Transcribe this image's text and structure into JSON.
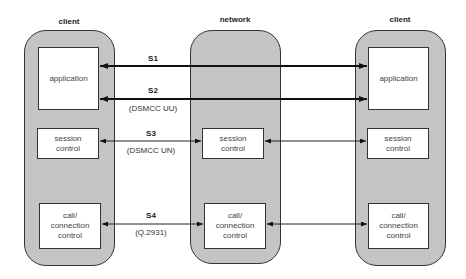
{
  "columns": {
    "left": {
      "title": "client",
      "application": "application",
      "session": "session control",
      "call": "call/ connection control"
    },
    "middle": {
      "title": "network",
      "session": "session control",
      "call": "call/ connection control"
    },
    "right": {
      "title": "client",
      "application": "application",
      "session": "session control",
      "call": "call/ connection control"
    }
  },
  "links": {
    "s1": {
      "label": "S1"
    },
    "s2": {
      "label": "S2",
      "protocol": "(DSMCC UU)"
    },
    "s3": {
      "label": "S3",
      "protocol": "(DSMCC UN)"
    },
    "s4": {
      "label": "S4",
      "protocol": "(Q.2931)"
    }
  }
}
